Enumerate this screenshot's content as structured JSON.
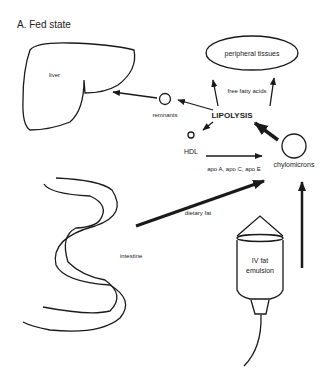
{
  "figure": {
    "title": "A. Fed state"
  },
  "nodes": {
    "liver": "liver",
    "peripheral_tissues": "peripheral tissues",
    "remnants": "remnants",
    "lipolysis": "LIPOLYSIS",
    "hdl": "HDL",
    "chylomicrons": "chylomicrons",
    "intestine": "intestine",
    "iv_line1": "IV fat",
    "iv_line2": "emulsion"
  },
  "edges": {
    "free_fatty_acids": "free fatty acids",
    "apo": "apo A, apo C, apo E",
    "dietary_fat": "dietary fat"
  },
  "colors": {
    "ink": "#1a1a1a",
    "background": "#ffffff"
  }
}
